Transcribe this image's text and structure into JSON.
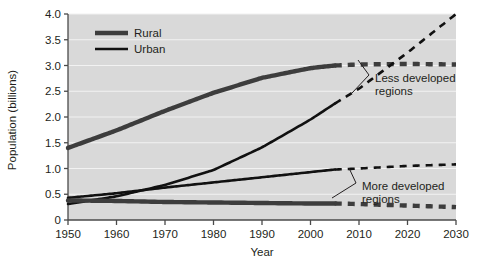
{
  "chart_data": {
    "type": "line",
    "title": "",
    "xlabel": "Year",
    "ylabel": "Population (billions)",
    "xlim": [
      1950,
      2030
    ],
    "ylim": [
      0,
      4.0
    ],
    "xticks": [
      1950,
      1960,
      1970,
      1980,
      1990,
      2000,
      2010,
      2020,
      2030
    ],
    "xtick_labels": [
      "1950",
      "1960",
      "1970",
      "1980",
      "1990",
      "2000",
      "2010",
      "2020",
      "2030"
    ],
    "yticks": [
      0,
      0.5,
      1.0,
      1.5,
      2.0,
      2.5,
      3.0,
      3.5,
      4.0
    ],
    "ytick_labels": [
      "0",
      "0.5",
      "1.0",
      "1.5",
      "2.0",
      "2.5",
      "3.0",
      "3.5",
      "4.0"
    ],
    "grid": true,
    "grid_axis": "y",
    "plot_background": "#d9d9d9",
    "legend_position": "top-left",
    "projection_start_year": 2005,
    "legend": [
      {
        "name": "Rural",
        "style": "solid",
        "width_px": 4.4,
        "color": "#3d3d3d"
      },
      {
        "name": "Urban",
        "style": "solid",
        "width_px": 2.6,
        "color": "#111111"
      }
    ],
    "annotations": [
      {
        "label": "Less developed regions",
        "lines": [
          "Less developed",
          "regions"
        ],
        "x": 2012,
        "y": 2.25
      },
      {
        "label": "More developed regions",
        "lines": [
          "More developed",
          "regions"
        ],
        "x": 2012,
        "y": 0.72
      }
    ],
    "series": [
      {
        "name": "Less developed regions - Rural",
        "region": "Less developed regions",
        "type": "Rural",
        "style": "solid",
        "projection_style": "dashed",
        "x": [
          1950,
          1960,
          1970,
          1980,
          1990,
          2000,
          2005,
          2010,
          2020,
          2030
        ],
        "values": [
          1.4,
          1.74,
          2.12,
          2.47,
          2.76,
          2.95,
          3.0,
          3.02,
          3.03,
          3.02
        ]
      },
      {
        "name": "Less developed regions - Urban",
        "region": "Less developed regions",
        "type": "Urban",
        "style": "solid",
        "projection_style": "dashed",
        "x": [
          1950,
          1960,
          1970,
          1980,
          1990,
          2000,
          2005,
          2010,
          2020,
          2030
        ],
        "values": [
          0.31,
          0.46,
          0.68,
          0.97,
          1.41,
          1.95,
          2.26,
          2.55,
          3.25,
          4.0
        ]
      },
      {
        "name": "More developed regions - Urban",
        "region": "More developed regions",
        "type": "Urban",
        "style": "solid",
        "projection_style": "dashed",
        "x": [
          1950,
          1960,
          1970,
          1980,
          1990,
          2000,
          2005,
          2010,
          2020,
          2030
        ],
        "values": [
          0.43,
          0.52,
          0.63,
          0.73,
          0.83,
          0.93,
          0.98,
          1.0,
          1.05,
          1.08
        ]
      },
      {
        "name": "More developed regions - Rural",
        "region": "More developed regions",
        "type": "Rural",
        "style": "solid",
        "projection_style": "dashed",
        "x": [
          1950,
          1960,
          1970,
          1980,
          1990,
          2000,
          2005,
          2010,
          2020,
          2030
        ],
        "values": [
          0.38,
          0.37,
          0.35,
          0.34,
          0.33,
          0.32,
          0.32,
          0.31,
          0.28,
          0.25
        ]
      }
    ]
  }
}
